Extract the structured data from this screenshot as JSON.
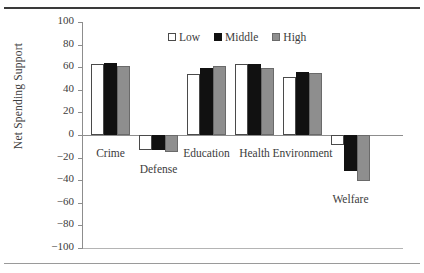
{
  "figure": {
    "ylabel": "Net Spending Support"
  },
  "legend": {
    "position": "top-center",
    "items": [
      {
        "label": "Low",
        "key": "low",
        "color": "#ffffff",
        "swatch": "open-square-icon"
      },
      {
        "label": "Middle",
        "key": "middle",
        "color": "#111111",
        "swatch": "filled-square-icon"
      },
      {
        "label": "High",
        "key": "high",
        "color": "#8e8e8e",
        "swatch": "gray-square-icon"
      }
    ]
  },
  "axis": {
    "ticks": [
      100,
      80,
      60,
      40,
      20,
      0,
      -20,
      -40,
      -60,
      -80,
      -100
    ],
    "tick_labels": [
      "100",
      "80",
      "60",
      "40",
      "20",
      "0",
      "−20",
      "−40",
      "−60",
      "−80",
      "−100"
    ]
  },
  "chart_data": {
    "type": "bar",
    "title": "",
    "xlabel": "",
    "ylabel": "Net Spending Support",
    "ylim": [
      -100,
      100
    ],
    "ytick_step": 20,
    "grid": false,
    "legend_position": "top-center",
    "categories": [
      "Crime",
      "Defense",
      "Education",
      "Health",
      "Environment",
      "Welfare"
    ],
    "series": [
      {
        "name": "Low",
        "color": "#ffffff",
        "values": [
          63,
          -13,
          54,
          63,
          51,
          -9
        ]
      },
      {
        "name": "Middle",
        "color": "#111111",
        "values": [
          64,
          -13,
          59,
          63,
          56,
          -32
        ]
      },
      {
        "name": "High",
        "color": "#8e8e8e",
        "values": [
          61,
          -15,
          61,
          59,
          55,
          -41
        ]
      }
    ]
  }
}
